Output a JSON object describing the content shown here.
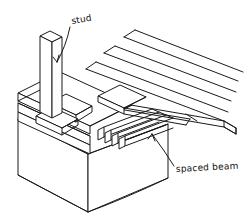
{
  "drawing": {
    "title": "Spaced beam and stud framing detail",
    "style": "hand-drawn isometric line sketch",
    "background_color": "#ffffff",
    "ink_color": "#1a1a1a",
    "width": 246,
    "height": 224
  },
  "labels": [
    {
      "id": "stud",
      "text": "stud",
      "x": 72,
      "y": 24,
      "rotation": -10,
      "leader_from": [
        70,
        27
      ],
      "leader_to": [
        57,
        62
      ]
    },
    {
      "id": "spaced-beam",
      "text": "spaced beam",
      "x": 176,
      "y": 172,
      "rotation": -3,
      "leader_from": [
        174,
        166
      ],
      "leader_to": [
        152,
        134
      ]
    }
  ],
  "components": [
    {
      "id": "foundation-wall",
      "name": "foundation wall block",
      "count": 1
    },
    {
      "id": "sill-plate-stack",
      "name": "stacked sill plates",
      "count": 3
    },
    {
      "id": "stud-post",
      "name": "vertical stud post",
      "count": 1
    },
    {
      "id": "blocking-members",
      "name": "blocking members",
      "count": 3
    },
    {
      "id": "spaced-beam-slats",
      "name": "spaced beam slats",
      "count": 4
    },
    {
      "id": "decking-planks",
      "name": "decking planks",
      "count": 4
    }
  ]
}
